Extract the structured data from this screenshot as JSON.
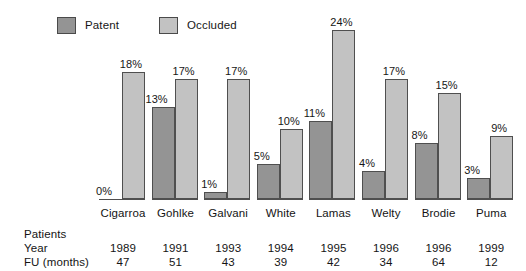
{
  "legend": {
    "entries": [
      {
        "label": "Patent",
        "color": "#949494",
        "icon": "legend-swatch-icon"
      },
      {
        "label": "Occluded",
        "color": "#c2c2c2",
        "icon": "legend-swatch-icon"
      }
    ]
  },
  "table": {
    "row_labels": [
      "Patients",
      "Year",
      "FU (months)"
    ]
  },
  "chart_data": {
    "type": "bar",
    "title": "",
    "xlabel": "",
    "ylabel": "",
    "ylim": [
      0,
      25
    ],
    "grid": false,
    "legend_position": "top-left",
    "value_label_suffix": "%",
    "categories": [
      "Cigarroa",
      "Gohlke",
      "Galvani",
      "White",
      "Lamas",
      "Welty",
      "Brodie",
      "Puma"
    ],
    "series": [
      {
        "name": "Patent",
        "color": "#949494",
        "values": [
          0,
          13,
          1,
          5,
          11,
          4,
          8,
          3
        ]
      },
      {
        "name": "Occluded",
        "color": "#c2c2c2",
        "values": [
          18,
          17,
          17,
          10,
          24,
          17,
          15,
          9
        ]
      }
    ],
    "value_labels": {
      "Patent": [
        "0%",
        "13%",
        "1%",
        "5%",
        "11%",
        "4%",
        "8%",
        "3%"
      ],
      "Occluded": [
        "18%",
        "17%",
        "17%",
        "10%",
        "24%",
        "17%",
        "15%",
        "9%"
      ]
    },
    "annotations": {
      "Patients": [
        "",
        "",
        "",
        "",
        "",
        "",
        "",
        ""
      ],
      "Year": [
        "1989",
        "1991",
        "1993",
        "1994",
        "1995",
        "1996",
        "1996",
        "1999"
      ],
      "FU (months)": [
        "47",
        "51",
        "43",
        "39",
        "42",
        "34",
        "64",
        "12"
      ]
    }
  }
}
